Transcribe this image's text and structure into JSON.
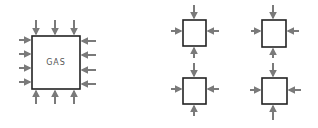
{
  "diagram": {
    "big_box": {
      "label": "GAS",
      "x": 32,
      "y": 36,
      "w": 48,
      "h": 53
    },
    "small_boxes": [
      {
        "x": 183,
        "y": 20,
        "w": 23,
        "h": 26
      },
      {
        "x": 262,
        "y": 20,
        "w": 24,
        "h": 27
      },
      {
        "x": 183,
        "y": 78,
        "w": 23,
        "h": 26
      },
      {
        "x": 262,
        "y": 78,
        "w": 25,
        "h": 26
      }
    ],
    "colors": {
      "box_stroke": "#222222",
      "arrow": "#7a7a7a",
      "label": "#555555"
    },
    "arrow_meaning": "pressure-arrows"
  }
}
